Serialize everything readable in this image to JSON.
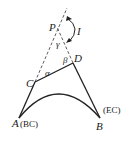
{
  "diagram": {
    "type": "simple-curve-with-inaccessible-intersection",
    "points": {
      "P": {
        "label": "P"
      },
      "C": {
        "label": "C"
      },
      "D": {
        "label": "D"
      },
      "A": {
        "label": "A",
        "tag": "(BC)"
      },
      "B": {
        "label": "B",
        "tag": "(EC)"
      }
    },
    "angles": {
      "alpha": "α",
      "beta": "β",
      "gamma": "γ",
      "intersection": "I"
    },
    "colors": {
      "line": "#222222",
      "background": "#ffffff"
    }
  }
}
